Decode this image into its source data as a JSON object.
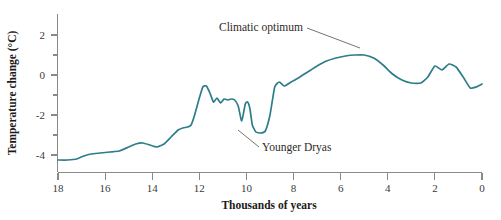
{
  "chart_data": {
    "type": "line",
    "title": "",
    "xlabel": "Thousands of years",
    "ylabel": "Temperature change (°C)",
    "xlim": [
      18,
      0
    ],
    "ylim": [
      -4.6,
      2.8
    ],
    "x_reversed": true,
    "grid": false,
    "legend": null,
    "line_color": "#2d7d8a",
    "xticks": [
      18,
      16,
      14,
      12,
      10,
      8,
      6,
      4,
      2,
      0
    ],
    "xtick_labels": [
      "18",
      "16",
      "14",
      "12",
      "10",
      "8",
      "6",
      "4",
      "2",
      "0"
    ],
    "xminor_ticks": [
      17,
      15,
      13,
      11,
      9,
      7,
      5,
      3,
      1
    ],
    "yticks": [
      2,
      0,
      -2,
      -4
    ],
    "ytick_labels": [
      "2",
      "0",
      "-2",
      "-4"
    ],
    "yminor_ticks": [
      1,
      -1,
      -3
    ],
    "series": [
      {
        "name": "Temperature change",
        "x": [
          18.0,
          17.6,
          17.2,
          16.9,
          16.6,
          16.2,
          15.8,
          15.4,
          15.0,
          14.7,
          14.4,
          14.1,
          13.8,
          13.5,
          13.2,
          12.9,
          12.7,
          12.5,
          12.35,
          12.2,
          12.0,
          11.85,
          11.7,
          11.55,
          11.4,
          11.25,
          11.1,
          10.95,
          10.8,
          10.65,
          10.5,
          10.35,
          10.2,
          10.05,
          9.95,
          9.85,
          9.75,
          9.6,
          9.4,
          9.2,
          9.0,
          8.8,
          8.6,
          8.4,
          8.1,
          7.8,
          7.4,
          7.0,
          6.6,
          6.2,
          5.8,
          5.4,
          5.0,
          4.6,
          4.2,
          3.8,
          3.4,
          3.0,
          2.6,
          2.3,
          2.0,
          1.7,
          1.4,
          1.1,
          0.8,
          0.5,
          0.25,
          0.0
        ],
        "values": [
          -4.25,
          -4.25,
          -4.2,
          -4.05,
          -3.95,
          -3.9,
          -3.85,
          -3.8,
          -3.6,
          -3.45,
          -3.4,
          -3.5,
          -3.6,
          -3.45,
          -3.1,
          -2.75,
          -2.65,
          -2.6,
          -2.5,
          -2.0,
          -1.15,
          -0.6,
          -0.55,
          -0.9,
          -1.35,
          -1.15,
          -1.4,
          -1.2,
          -1.25,
          -1.2,
          -1.25,
          -1.55,
          -2.3,
          -1.45,
          -1.35,
          -1.7,
          -2.5,
          -2.85,
          -2.9,
          -2.8,
          -2.0,
          -0.6,
          -0.35,
          -0.55,
          -0.35,
          -0.15,
          0.15,
          0.45,
          0.7,
          0.85,
          0.95,
          1.0,
          1.0,
          0.85,
          0.5,
          0.05,
          -0.25,
          -0.4,
          -0.4,
          -0.1,
          0.45,
          0.25,
          0.55,
          0.4,
          -0.1,
          -0.65,
          -0.6,
          -0.45
        ]
      }
    ],
    "annotations": [
      {
        "id": "climatic-optimum",
        "text": "Climatic optimum",
        "label_x": 219,
        "label_y": 31,
        "leader_from_x": 307,
        "leader_from_y": 28,
        "leader_to_x": 360,
        "leader_to_y": 48
      },
      {
        "id": "younger-dryas",
        "text": "Younger Dryas",
        "label_x": 262,
        "label_y": 151,
        "leader_from_x": 259,
        "leader_from_y": 147,
        "leader_to_x": 238,
        "leader_to_y": 130
      }
    ]
  }
}
